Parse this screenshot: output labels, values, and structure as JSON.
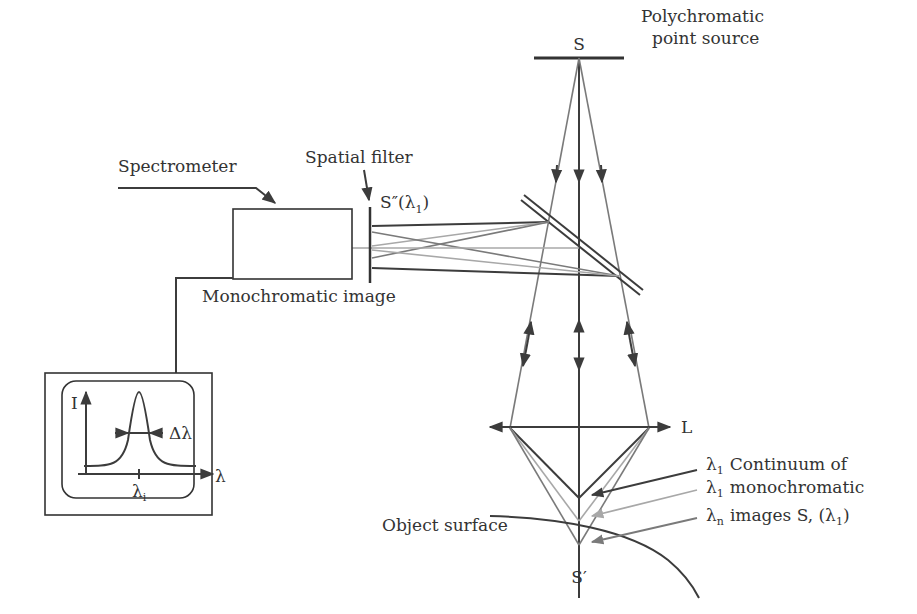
{
  "diagram": {
    "labels": {
      "source_letter": "S",
      "source_desc_line1": "Polychromatic",
      "source_desc_line2": "point source",
      "spectrometer": "Spectrometer",
      "spatial_filter": "Spatial filter",
      "filter_image": "S″(λ",
      "filter_image_sub": "1",
      "filter_image_close": ")",
      "monochromatic_image": "Monochromatic image",
      "lens": "L",
      "object_surface": "Object surface",
      "focus_point": "S′",
      "continuum": [
        {
          "lambda": "λ",
          "sub": "1",
          "text": "Continuum of"
        },
        {
          "lambda": "λ",
          "sub": "1",
          "text": "monochromatic"
        },
        {
          "lambda": "λ",
          "sub": "n",
          "text": "images S, (λ",
          "sub2": "1",
          "close": ")"
        }
      ]
    },
    "spectrum_plot": {
      "y_label": "I",
      "x_label": "λ",
      "peak_label": "λ",
      "peak_sub": "i",
      "width_label": "Δλ"
    },
    "colors": {
      "dark_ray": "#3c3c3c",
      "medium_ray": "#7a7a7a",
      "light_ray": "#a8a8a8",
      "text": "#333333"
    }
  }
}
